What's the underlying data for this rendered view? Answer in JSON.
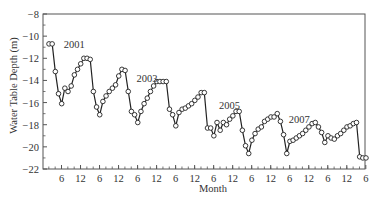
{
  "chart_data": {
    "type": "line",
    "title": "",
    "xlabel": "Month",
    "ylabel": "Water Table Depth (m)",
    "ylim": [
      -22,
      -8
    ],
    "yticks": [
      -8,
      -10,
      -12,
      -14,
      -16,
      -18,
      -20,
      -22
    ],
    "xtick_labels": [
      "6",
      "12",
      "6",
      "12",
      "6",
      "12",
      "6",
      "12",
      "6",
      "12",
      "6",
      "12",
      "6",
      "12",
      "6",
      "12",
      "6"
    ],
    "grid": false,
    "legend": null,
    "marker": "open-circle",
    "annotations": [
      {
        "text": "2001",
        "x_index": 4,
        "y": -10.7
      },
      {
        "text": "2003",
        "x_index": 27,
        "y": -13.8
      },
      {
        "text": "2005",
        "x_index": 53,
        "y": -16.2
      },
      {
        "text": "2007",
        "x_index": 75,
        "y": -17.5
      }
    ],
    "series": [
      {
        "name": "Water table depth",
        "start": "2001-02",
        "interval": "month",
        "values": [
          -10.7,
          -10.7,
          -13.2,
          -15.2,
          -16.1,
          -14.7,
          -15.0,
          -14.5,
          -13.5,
          -13.0,
          -12.5,
          -12.0,
          -12.0,
          -12.1,
          -15.0,
          -16.4,
          -17.1,
          -15.9,
          -15.4,
          -15.0,
          -14.7,
          -14.4,
          -13.6,
          -13.0,
          -13.1,
          -15.0,
          -16.8,
          -17.1,
          -17.8,
          -16.8,
          -16.1,
          -15.6,
          -15.0,
          -14.5,
          -14.1,
          -14.1,
          -14.1,
          -14.1,
          -16.6,
          -17.1,
          -18.1,
          -16.9,
          -16.6,
          -16.5,
          -16.3,
          -16.1,
          -15.8,
          -15.5,
          -15.1,
          -15.1,
          -18.3,
          -18.3,
          -19.0,
          -17.8,
          -18.5,
          -17.8,
          -18.0,
          -17.5,
          -17.2,
          -16.8,
          -16.8,
          -18.5,
          -19.9,
          -20.6,
          -19.4,
          -18.8,
          -18.4,
          -18.2,
          -17.7,
          -17.5,
          -17.3,
          -17.3,
          -17.0,
          -17.7,
          -18.9,
          -20.6,
          -19.5,
          -19.4,
          -19.2,
          -19.0,
          -18.8,
          -18.5,
          -18.2,
          -17.9,
          -17.8,
          -18.2,
          -18.7,
          -19.6,
          -19.0,
          -19.2,
          -19.3,
          -19.0,
          -18.8,
          -18.5,
          -18.2,
          -18.1,
          -17.9,
          -17.8,
          -20.9,
          -21.0,
          -21.0
        ]
      }
    ]
  }
}
